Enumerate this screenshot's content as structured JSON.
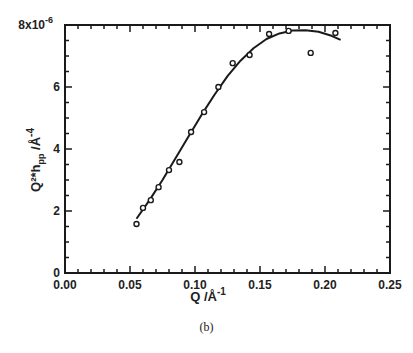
{
  "chart_data": {
    "type": "scatter",
    "title": "",
    "caption": "(b)",
    "xlabel": "Q /Å",
    "xlabel_superscript": "-1",
    "ylabel": "Q²*h",
    "ylabel_subscript": "pp",
    "ylabel_suffix": " /Å",
    "ylabel_superscript": "-4",
    "xlim": [
      0.0,
      0.25
    ],
    "ylim": [
      0,
      8e-06
    ],
    "x_ticks": [
      "0.00",
      "0.05",
      "0.10",
      "0.15",
      "0.20",
      "0.25"
    ],
    "x_tick_values": [
      0.0,
      0.05,
      0.1,
      0.15,
      0.2,
      0.25
    ],
    "y_ticks": [
      "0",
      "2",
      "4",
      "6",
      "8x10"
    ],
    "y_tick_values": [
      0,
      2e-06,
      4e-06,
      6e-06,
      8e-06
    ],
    "y_top_exponent": "-6",
    "grid": false,
    "legend": null,
    "series": [
      {
        "name": "data",
        "style": "open-circle",
        "x": [
          0.055,
          0.06,
          0.066,
          0.072,
          0.08,
          0.088,
          0.097,
          0.107,
          0.118,
          0.129,
          0.142,
          0.157,
          0.172,
          0.189,
          0.208
        ],
        "y": [
          1.58e-06,
          2.1e-06,
          2.35e-06,
          2.77e-06,
          3.32e-06,
          3.58e-06,
          4.55e-06,
          5.19e-06,
          6e-06,
          6.77e-06,
          7.03e-06,
          7.71e-06,
          7.81e-06,
          7.1e-06,
          7.74e-06
        ]
      },
      {
        "name": "fit",
        "style": "line",
        "x": [
          0.055,
          0.065,
          0.075,
          0.085,
          0.095,
          0.105,
          0.115,
          0.125,
          0.135,
          0.145,
          0.155,
          0.165,
          0.175,
          0.185,
          0.195,
          0.205,
          0.212
        ],
        "y": [
          1.75e-06,
          2.35e-06,
          3e-06,
          3.7e-06,
          4.4e-06,
          5.1e-06,
          5.75e-06,
          6.35e-06,
          6.85e-06,
          7.25e-06,
          7.55e-06,
          7.73e-06,
          7.82e-06,
          7.83e-06,
          7.78e-06,
          7.65e-06,
          7.52e-06
        ]
      }
    ]
  }
}
